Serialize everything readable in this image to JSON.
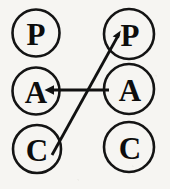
{
  "diagram": {
    "background_color": "#f6f5f2",
    "stroke_color": "#141414",
    "text_color": "#0d0d0d",
    "columns": [
      {
        "name": "left-column",
        "nodes": [
          {
            "id": "left-p",
            "label": "P",
            "cx": 36,
            "cy": 33,
            "r": 23.5
          },
          {
            "id": "left-a",
            "label": "A",
            "cx": 36,
            "cy": 91,
            "r": 23.5
          },
          {
            "id": "left-c",
            "label": "C",
            "cx": 37,
            "cy": 149,
            "r": 24.0
          }
        ]
      },
      {
        "name": "right-column",
        "nodes": [
          {
            "id": "right-p",
            "label": "P",
            "cx": 129,
            "cy": 34,
            "r": 25.0
          },
          {
            "id": "right-a",
            "label": "A",
            "cx": 129,
            "cy": 89,
            "r": 25.0
          },
          {
            "id": "right-c",
            "label": "C",
            "cx": 129,
            "cy": 147,
            "r": 25.0
          }
        ]
      }
    ],
    "edges": [
      {
        "id": "edge-right-a-to-left-a",
        "name": "horizontal-arrow",
        "from": "right-a",
        "to": "left-a",
        "x1": 109,
        "y1": 90,
        "x2": 46,
        "y2": 90,
        "arrowhead": "to"
      },
      {
        "id": "edge-left-c-to-right-p",
        "name": "diagonal-arrow",
        "from": "left-c",
        "to": "right-p",
        "x1": 52,
        "y1": 155,
        "x2": 120,
        "y2": 33,
        "arrowhead": "to"
      }
    ]
  }
}
